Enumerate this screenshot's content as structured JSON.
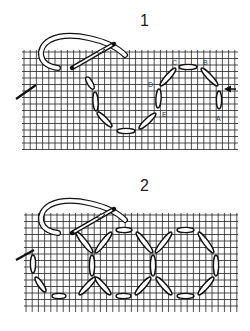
{
  "panels": [
    {
      "number": "1",
      "number_pos": [
        140,
        12
      ],
      "grid": {
        "x0": 22,
        "x1": 238,
        "y0": 50,
        "y1": 150,
        "step_x": 6.2,
        "step_y": 6.5
      },
      "stitches": [
        [
          87,
          78,
          93,
          88
        ],
        [
          95,
          93,
          96,
          110
        ],
        [
          98,
          113,
          111,
          126
        ],
        [
          118,
          131,
          134,
          131
        ],
        [
          140,
          128,
          155,
          114
        ],
        [
          158,
          107,
          159,
          90
        ],
        [
          161,
          85,
          175,
          69
        ],
        [
          180,
          67,
          196,
          67
        ],
        [
          202,
          69,
          217,
          85
        ],
        [
          219,
          92,
          219,
          108
        ]
      ],
      "labels": [
        {
          "text": "C",
          "x": 172,
          "y": 59
        },
        {
          "text": "B",
          "x": 203,
          "y": 59
        },
        {
          "text": "D",
          "x": 148,
          "y": 81
        },
        {
          "text": "E",
          "x": 162,
          "y": 111
        },
        {
          "text": "A",
          "x": 216,
          "y": 115
        }
      ],
      "arrow": {
        "x1": 236,
        "y1": 89,
        "x2": 224,
        "y2": 89
      },
      "needle_left": {
        "x1": 16,
        "y1": 99,
        "x2": 36,
        "y2": 85
      },
      "thread_needle": true
    },
    {
      "number": "2",
      "number_pos": [
        140,
        177
      ],
      "grid": {
        "x0": 24,
        "x1": 238,
        "y0": 213,
        "y1": 312,
        "step_x": 6.2,
        "step_y": 6.5
      },
      "stitches": [
        [
          77,
          233,
          92,
          252
        ],
        [
          92,
          256,
          92,
          275
        ],
        [
          95,
          278,
          80,
          294
        ],
        [
          65,
          296,
          53,
          296
        ],
        [
          45,
          291,
          36,
          278
        ],
        [
          33,
          272,
          33,
          256
        ],
        [
          96,
          252,
          111,
          233
        ],
        [
          117,
          230,
          131,
          230
        ],
        [
          137,
          233,
          152,
          252
        ],
        [
          153,
          256,
          153,
          275
        ],
        [
          156,
          252,
          171,
          233
        ],
        [
          178,
          230,
          193,
          230
        ],
        [
          199,
          233,
          213,
          252
        ],
        [
          216,
          256,
          216,
          275
        ],
        [
          213,
          278,
          199,
          294
        ],
        [
          193,
          296,
          178,
          296
        ],
        [
          171,
          294,
          157,
          278
        ],
        [
          150,
          278,
          136,
          294
        ],
        [
          130,
          296,
          117,
          296
        ],
        [
          110,
          294,
          96,
          278
        ]
      ],
      "labels": [],
      "needle_left": {
        "x1": 16,
        "y1": 260,
        "x2": 34,
        "y2": 250
      },
      "thread_needle": true
    }
  ]
}
